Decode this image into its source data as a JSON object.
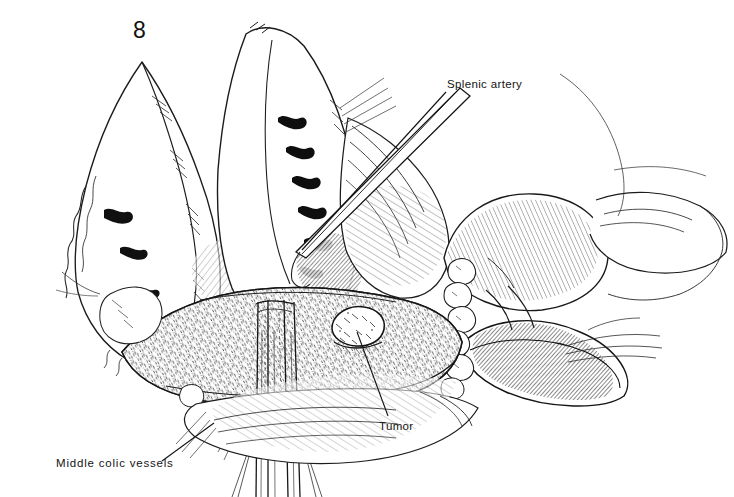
{
  "figure": {
    "number": "8",
    "domain": "medical-surgical-illustration",
    "style": "pen-and-ink line drawing, black on white",
    "background_color": "#ffffff",
    "ink_color": "#111111",
    "width": 734,
    "height": 497
  },
  "annotations": [
    {
      "id": "splenic-artery",
      "label": "Splenic artery",
      "text_x": 447,
      "text_y": 79,
      "leader_from": [
        446,
        92
      ],
      "leader_to": [
        300,
        248
      ]
    },
    {
      "id": "tumor",
      "label": "Tumor",
      "text_x": 379,
      "text_y": 421,
      "leader_from": [
        388,
        416
      ],
      "leader_to": [
        357,
        330
      ]
    },
    {
      "id": "middle-colic-vessels",
      "label": "Middle colic vessels",
      "text_x": 56,
      "text_y": 458,
      "leader_from": [
        162,
        461
      ],
      "leader_to": [
        212,
        424
      ]
    }
  ],
  "anatomy": [
    {
      "id": "liver-left-lobe",
      "label": "Liver left lobe",
      "region": "upper-left"
    },
    {
      "id": "stomach",
      "label": "Stomach, retracted upward",
      "region": "upper-center"
    },
    {
      "id": "pancreas-body",
      "label": "Pancreas body and tail",
      "region": "center-lower"
    },
    {
      "id": "tumor-nodule",
      "label": "Tumor nodule on pancreas",
      "region": "center"
    },
    {
      "id": "spleen",
      "label": "Spleen",
      "region": "right"
    },
    {
      "id": "lymph-node-chain",
      "label": "Lymph node chain",
      "region": "center-right"
    },
    {
      "id": "middle-colic-vessel-bundle",
      "label": "Middle colic vessel bundle",
      "region": "bottom-center"
    },
    {
      "id": "transverse-mesocolon",
      "label": "Transverse mesocolon",
      "region": "bottom"
    }
  ]
}
